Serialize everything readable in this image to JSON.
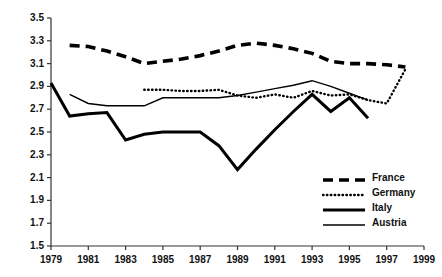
{
  "chart_data": {
    "type": "line",
    "title": "",
    "xlabel": "",
    "ylabel": "",
    "xlim": [
      1979,
      1999
    ],
    "ylim": [
      1.5,
      3.5
    ],
    "grid": false,
    "legend_position": "bottom-right",
    "x_ticks": [
      "1979",
      "1981",
      "1983",
      "1985",
      "1987",
      "1989",
      "1991",
      "1993",
      "1995",
      "1997",
      "1999"
    ],
    "y_ticks": [
      "1.5",
      "1.7",
      "1.9",
      "2.1",
      "2.3",
      "2.5",
      "2.7",
      "2.9",
      "3.1",
      "3.3",
      "3.5"
    ],
    "x_tick_values": [
      1979,
      1981,
      1983,
      1985,
      1987,
      1989,
      1991,
      1993,
      1995,
      1997,
      1999
    ],
    "y_tick_values": [
      1.5,
      1.7,
      1.9,
      2.1,
      2.3,
      2.5,
      2.7,
      2.9,
      3.1,
      3.3,
      3.5
    ],
    "series": [
      {
        "name": "France",
        "style": "dashed-thick",
        "color": "#000000",
        "x": [
          1980,
          1981,
          1982,
          1983,
          1984,
          1985,
          1986,
          1987,
          1988,
          1989,
          1990,
          1991,
          1992,
          1993,
          1994,
          1995,
          1996,
          1997,
          1998
        ],
        "values": [
          3.26,
          3.25,
          3.21,
          3.16,
          3.1,
          3.12,
          3.14,
          3.17,
          3.21,
          3.26,
          3.28,
          3.26,
          3.23,
          3.19,
          3.12,
          3.1,
          3.1,
          3.09,
          3.07
        ]
      },
      {
        "name": "Germany",
        "style": "dotted",
        "color": "#000000",
        "x": [
          1984,
          1985,
          1986,
          1987,
          1988,
          1989,
          1990,
          1991,
          1992,
          1993,
          1994,
          1995,
          1996,
          1997,
          1998
        ],
        "values": [
          2.87,
          2.87,
          2.86,
          2.86,
          2.87,
          2.82,
          2.8,
          2.83,
          2.8,
          2.86,
          2.82,
          2.83,
          2.78,
          2.75,
          3.05
        ]
      },
      {
        "name": "Italy",
        "style": "solid-thick",
        "color": "#000000",
        "x": [
          1979,
          1980,
          1981,
          1982,
          1983,
          1984,
          1985,
          1986,
          1987,
          1988,
          1989,
          1990,
          1991,
          1992,
          1993,
          1994,
          1995,
          1996
        ],
        "values": [
          2.93,
          2.64,
          2.66,
          2.67,
          2.43,
          2.48,
          2.5,
          2.5,
          2.5,
          2.38,
          2.17,
          2.35,
          2.52,
          2.68,
          2.83,
          2.68,
          2.8,
          2.62
        ]
      },
      {
        "name": "Austria",
        "style": "solid-thin",
        "color": "#000000",
        "x": [
          1980,
          1981,
          1982,
          1983,
          1984,
          1985,
          1986,
          1987,
          1988,
          1989,
          1990,
          1991,
          1992,
          1993,
          1994,
          1995,
          1996
        ],
        "values": [
          2.83,
          2.75,
          2.73,
          2.73,
          2.73,
          2.8,
          2.8,
          2.8,
          2.8,
          2.82,
          2.85,
          2.88,
          2.91,
          2.95,
          2.9,
          2.84,
          2.78
        ]
      }
    ]
  },
  "legend": {
    "items": [
      {
        "label": "France"
      },
      {
        "label": "Germany"
      },
      {
        "label": "Italy"
      },
      {
        "label": "Austria"
      }
    ]
  }
}
